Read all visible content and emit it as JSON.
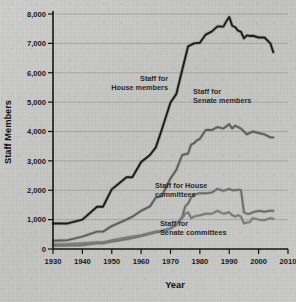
{
  "chart_data": {
    "type": "line",
    "title": "",
    "xlabel": "Year",
    "ylabel": "Staff Members",
    "xlim": [
      1930,
      2010
    ],
    "ylim": [
      0,
      8000
    ],
    "grid": "horizontal",
    "legend_position": "inline-annotations",
    "x_ticks": [
      "1930",
      "1940",
      "1950",
      "1960",
      "1970",
      "1980",
      "1990",
      "2000",
      "2010"
    ],
    "y_ticks": [
      "0",
      "1,000",
      "2,000",
      "3,000",
      "4,000",
      "5,000",
      "6,000",
      "7,000",
      "8,000"
    ],
    "series": [
      {
        "name": "Staff for House members",
        "label_lines": [
          "Staff for",
          "House members"
        ],
        "color": "#1c1c1c",
        "x": [
          1930,
          1935,
          1940,
          1945,
          1947,
          1950,
          1955,
          1957,
          1960,
          1963,
          1965,
          1967,
          1970,
          1972,
          1974,
          1976,
          1978,
          1980,
          1982,
          1984,
          1986,
          1988,
          1989,
          1990,
          1991,
          1992,
          1993,
          1994,
          1995,
          1996,
          1997,
          1998,
          2000,
          2002,
          2004,
          2005
        ],
        "values": [
          870,
          870,
          1000,
          1440,
          1440,
          2030,
          2440,
          2440,
          2960,
          3200,
          3460,
          4050,
          4990,
          5280,
          6100,
          6900,
          7000,
          7020,
          7300,
          7400,
          7580,
          7570,
          7750,
          7900,
          7600,
          7550,
          7430,
          7390,
          7170,
          7270,
          7250,
          7260,
          7200,
          7200,
          7000,
          6700
        ]
      },
      {
        "name": "Staff for Senate members",
        "label_lines": [
          "Staff for",
          "Senate members"
        ],
        "color": "#5e5e5c",
        "x": [
          1930,
          1935,
          1940,
          1945,
          1947,
          1950,
          1955,
          1957,
          1960,
          1963,
          1965,
          1967,
          1970,
          1972,
          1974,
          1976,
          1977,
          1978,
          1979,
          1980,
          1982,
          1984,
          1985,
          1986,
          1988,
          1990,
          1991,
          1992,
          1993,
          1994,
          1995,
          1996,
          1997,
          1998,
          2000,
          2002,
          2004,
          2005
        ],
        "values": [
          280,
          300,
          420,
          590,
          590,
          780,
          1000,
          1100,
          1300,
          1450,
          1750,
          1800,
          2400,
          2700,
          3200,
          3250,
          3550,
          3600,
          3700,
          3750,
          4050,
          4050,
          4100,
          4150,
          4100,
          4250,
          4100,
          4200,
          4150,
          4100,
          4000,
          3900,
          3950,
          4000,
          3950,
          3900,
          3800,
          3800
        ]
      },
      {
        "name": "Staff for House committees",
        "label_lines": [
          "Staff for House",
          "committees"
        ],
        "color": "#6e6e6c",
        "x": [
          1930,
          1935,
          1940,
          1945,
          1947,
          1950,
          1955,
          1960,
          1965,
          1967,
          1970,
          1972,
          1974,
          1975,
          1976,
          1977,
          1978,
          1980,
          1982,
          1984,
          1985,
          1986,
          1988,
          1990,
          1991,
          1992,
          1993,
          1994,
          1995,
          1996,
          1997,
          1998,
          2000,
          2002,
          2004,
          2005
        ],
        "values": [
          110,
          115,
          130,
          190,
          190,
          250,
          330,
          440,
          570,
          590,
          700,
          820,
          1100,
          1450,
          1550,
          1750,
          1850,
          1900,
          1900,
          1920,
          1980,
          2050,
          1980,
          2050,
          2000,
          2000,
          2020,
          2000,
          1250,
          1200,
          1200,
          1250,
          1300,
          1270,
          1300,
          1300
        ]
      },
      {
        "name": "Staff for Senate committees",
        "label_lines": [
          "Staff for",
          "Senate committees"
        ],
        "color": "#7b7b79",
        "x": [
          1930,
          1935,
          1940,
          1945,
          1947,
          1950,
          1955,
          1960,
          1965,
          1967,
          1970,
          1972,
          1974,
          1975,
          1976,
          1977,
          1978,
          1980,
          1982,
          1984,
          1985,
          1986,
          1988,
          1990,
          1991,
          1992,
          1993,
          1994,
          1995,
          1996,
          1997,
          1998,
          2000,
          2002,
          2004,
          2005
        ],
        "values": [
          160,
          170,
          200,
          230,
          230,
          300,
          390,
          470,
          600,
          620,
          700,
          850,
          1050,
          1200,
          1250,
          1050,
          1100,
          1150,
          1200,
          1200,
          1250,
          1300,
          1200,
          1250,
          1150,
          1100,
          1150,
          1100,
          870,
          900,
          920,
          1050,
          1000,
          980,
          1050,
          1030
        ]
      }
    ]
  }
}
